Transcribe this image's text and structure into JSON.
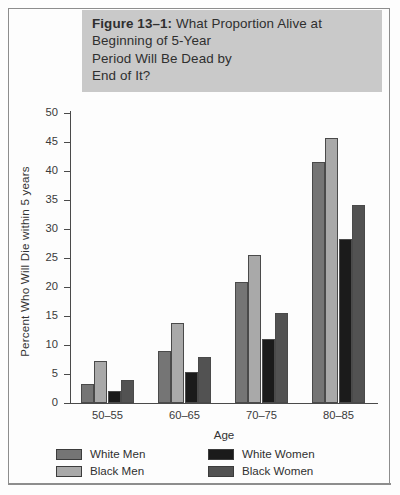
{
  "figure": {
    "caption_label": "Figure 13–1:",
    "caption_body": " What Proportion Alive at\nBeginning of 5-Year\nPeriod Will Be Dead by\nEnd of It?",
    "caption_full": "Figure 13–1: What Proportion Alive at Beginning of 5-Year Period Will Be Dead by End of It?",
    "band_color": "#c9c9c9"
  },
  "chart_data": {
    "type": "bar",
    "title": "Figure 13–1: What Proportion Alive at Beginning of 5-Year Period Will Be Dead by End of It?",
    "xlabel": "Age",
    "ylabel": "Percent Who Will Die within 5 years",
    "categories": [
      "50–55",
      "60–65",
      "70–75",
      "80–85"
    ],
    "series": [
      {
        "name": "White Men",
        "color": "#757575",
        "values": [
          3.3,
          9.0,
          20.8,
          41.6
        ]
      },
      {
        "name": "Black Men",
        "color": "#a9a9a9",
        "values": [
          7.3,
          13.8,
          25.6,
          45.7
        ]
      },
      {
        "name": "White Women",
        "color": "#1b1b1b",
        "values": [
          2.1,
          5.4,
          11.1,
          28.2
        ]
      },
      {
        "name": "Black Women",
        "color": "#525252",
        "values": [
          4.0,
          8.0,
          15.6,
          34.1
        ]
      }
    ],
    "ylim": [
      0,
      50
    ],
    "yticks": [
      0,
      5,
      10,
      15,
      20,
      25,
      30,
      35,
      40,
      45,
      50
    ],
    "ytick_labels": [
      "0",
      "5",
      "10",
      "15",
      "20",
      "25",
      "30",
      "35",
      "40",
      "45",
      "50"
    ],
    "grid": false,
    "legend_position": "bottom",
    "bar_border_color": "#4a4a4a",
    "axis_color": "#4a4a4a"
  }
}
